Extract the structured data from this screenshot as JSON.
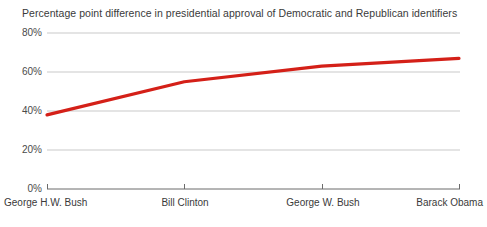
{
  "chart_data": {
    "type": "line",
    "title": "Percentage point difference in presidential approval of Democratic and Republican identifiers",
    "xlabel": "",
    "ylabel": "",
    "categories": [
      "George H.W. Bush",
      "Bill Clinton",
      "George W. Bush",
      "Barack Obama"
    ],
    "series": [
      {
        "name": "Percentage point difference",
        "color": "#d42018",
        "values": [
          38,
          55,
          63,
          67
        ]
      }
    ],
    "ylim": [
      0,
      80
    ],
    "ytick_labels": [
      "0%",
      "20%",
      "40%",
      "60%",
      "80%"
    ],
    "ytick_values": [
      0,
      20,
      40,
      60,
      80
    ],
    "grid": true,
    "legend": false,
    "legend_position": "none"
  },
  "axes": {
    "y_ticks": [
      {
        "label": "80%",
        "value": 80
      },
      {
        "label": "60%",
        "value": 60
      },
      {
        "label": "40%",
        "value": 40
      },
      {
        "label": "20%",
        "value": 20
      },
      {
        "label": "0%",
        "value": 0
      }
    ],
    "x_ticks": [
      {
        "label": "George H.W. Bush"
      },
      {
        "label": "Bill Clinton"
      },
      {
        "label": "George W. Bush"
      },
      {
        "label": "Barack Obama"
      }
    ]
  },
  "colors": {
    "line": "#d42018",
    "gridline": "#c9c9c9",
    "axis": "#6b6b6b",
    "text": "#3a3a3a",
    "background": "#ffffff"
  }
}
